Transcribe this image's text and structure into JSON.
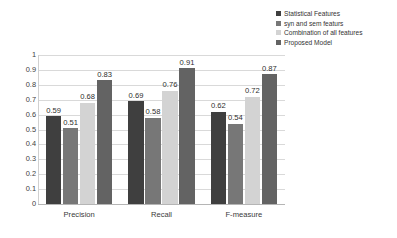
{
  "chart_data": {
    "type": "bar",
    "title": "",
    "xlabel": "",
    "ylabel": "",
    "ylim": [
      0,
      1
    ],
    "ytick_step": 0.1,
    "grid": true,
    "legend_position": "top-right",
    "categories": [
      "Precision",
      "Recall",
      "F-measure"
    ],
    "ytick_labels": [
      "1",
      "0.9",
      "0.8",
      "0.7",
      "0.6",
      "0.5",
      "0.4",
      "0.3",
      "0.2",
      "0.1",
      "0"
    ],
    "series": [
      {
        "name": "Statistical Features",
        "color": "#3f3f3f",
        "values": [
          0.59,
          0.69,
          0.62
        ],
        "labels": [
          "0.59",
          "0.69",
          "0.62"
        ]
      },
      {
        "name": "syn and sem featurs",
        "color": "#777777",
        "values": [
          0.51,
          0.58,
          0.54
        ],
        "labels": [
          "0.51",
          "0.58",
          "0.54"
        ]
      },
      {
        "name": "Combination of all features",
        "color": "#d3d3d3",
        "values": [
          0.68,
          0.76,
          0.72
        ],
        "labels": [
          "0.68",
          "0.76",
          "0.72"
        ]
      },
      {
        "name": "Proposed Model",
        "color": "#636363",
        "values": [
          0.83,
          0.91,
          0.87
        ],
        "labels": [
          "0.83",
          "0.91",
          "0.87"
        ]
      }
    ]
  },
  "legend": {
    "items": [
      {
        "label": "Statistical Features",
        "color": "#3f3f3f"
      },
      {
        "label": "syn and sem featurs",
        "color": "#777777"
      },
      {
        "label": "Combination of all features",
        "color": "#d3d3d3"
      },
      {
        "label": "Proposed Model",
        "color": "#636363"
      }
    ]
  },
  "axes": {
    "y_max_label": "1",
    "y_min_label": "0"
  }
}
